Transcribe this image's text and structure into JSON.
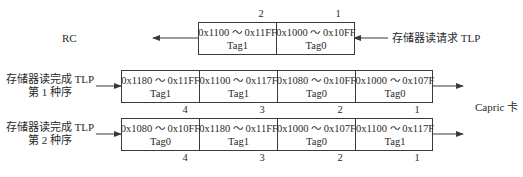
{
  "top": {
    "left_label": "RC",
    "right_label": "存储器读请求 TLP",
    "cells": [
      {
        "range": "0x1100 ～ 0x11FF",
        "tag": "Tag1",
        "index": "2"
      },
      {
        "range": "0x1000 ～ 0x10FF",
        "tag": "Tag0",
        "index": "1"
      }
    ]
  },
  "order1": {
    "label_line1": "存储器读完成 TLP",
    "label_line2": "第 1 种序",
    "cells": [
      {
        "range": "0x1180 ～ 0x11FF",
        "tag": "Tag1",
        "index": "4"
      },
      {
        "range": "0x1100 ～ 0x117F",
        "tag": "Tag1",
        "index": "3"
      },
      {
        "range": "0x1080 ～ 0x10FF",
        "tag": "Tag0",
        "index": "2"
      },
      {
        "range": "0x1000 ～ 0x107F",
        "tag": "Tag0",
        "index": "1"
      }
    ]
  },
  "order2": {
    "label_line1": "存储器读完成 TLP",
    "label_line2": "第 2 种序",
    "cells": [
      {
        "range": "0x1080 ～ 0x10FF",
        "tag": "Tag0",
        "index": "4"
      },
      {
        "range": "0x1180 ～ 0x11FF",
        "tag": "Tag1",
        "index": "3"
      },
      {
        "range": "0x1000 ～ 0x107F",
        "tag": "Tag0",
        "index": "2"
      },
      {
        "range": "0x1100 ～ 0x117F",
        "tag": "Tag1",
        "index": "1"
      }
    ]
  },
  "destination_label": "Capric 卡"
}
